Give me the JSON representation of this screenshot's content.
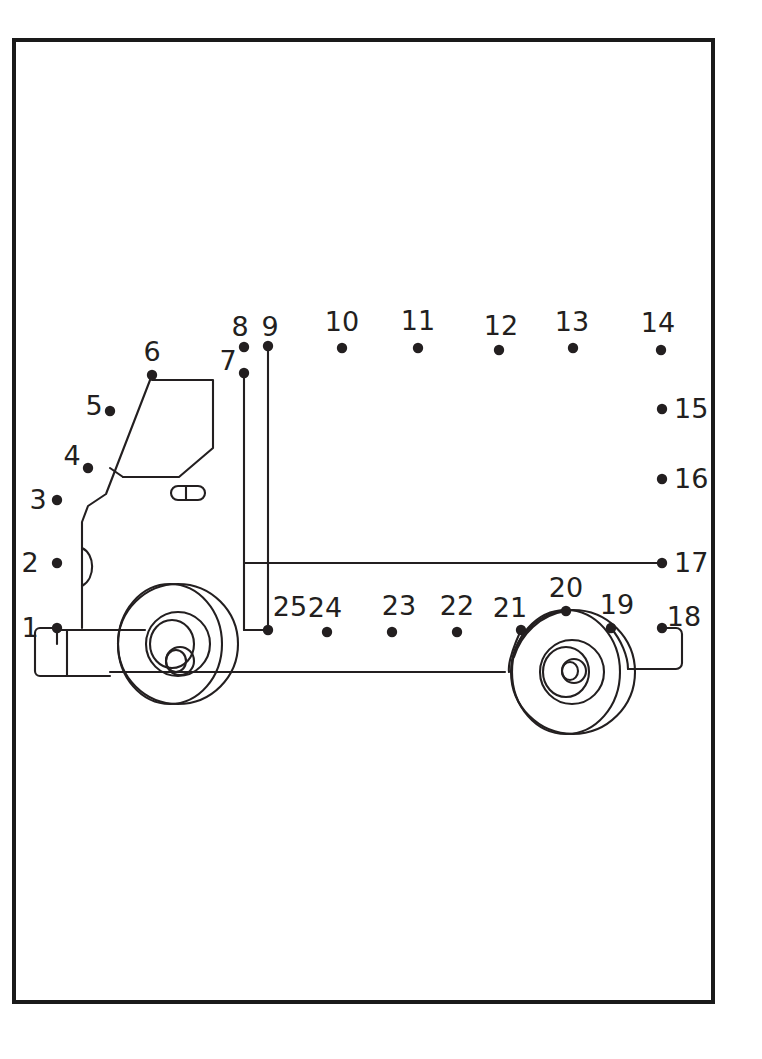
{
  "page": {
    "width": 762,
    "height": 1059,
    "background_color": "#ffffff",
    "ink_color": "#231f20",
    "border_color": "#1a1a1a"
  },
  "frame": {
    "name": "page-border",
    "x": 14,
    "y": 40,
    "width": 699,
    "height": 962,
    "stroke_width": 4
  },
  "puzzle": {
    "type": "connect-the-dots",
    "subject": "truck",
    "dot_count": 25,
    "dot_radius": 5.2,
    "label_font_size": 27,
    "dots": [
      {
        "number": "1",
        "x": 57,
        "y": 628,
        "label_x": 30,
        "label_y": 637,
        "label_anchor": "middle"
      },
      {
        "number": "2",
        "x": 57,
        "y": 563,
        "label_x": 30,
        "label_y": 572,
        "label_anchor": "middle"
      },
      {
        "number": "3",
        "x": 57,
        "y": 500,
        "label_x": 38,
        "label_y": 509,
        "label_anchor": "middle"
      },
      {
        "number": "4",
        "x": 88,
        "y": 468,
        "label_x": 72,
        "label_y": 465,
        "label_anchor": "middle"
      },
      {
        "number": "5",
        "x": 110,
        "y": 411,
        "label_x": 94,
        "label_y": 415,
        "label_anchor": "middle"
      },
      {
        "number": "6",
        "x": 152,
        "y": 375,
        "label_x": 152,
        "label_y": 361,
        "label_anchor": "middle"
      },
      {
        "number": "7",
        "x": 244,
        "y": 373,
        "label_x": 228,
        "label_y": 370,
        "label_anchor": "middle"
      },
      {
        "number": "8",
        "x": 244,
        "y": 347,
        "label_x": 240,
        "label_y": 336,
        "label_anchor": "middle"
      },
      {
        "number": "9",
        "x": 268,
        "y": 346,
        "label_x": 270,
        "label_y": 336,
        "label_anchor": "middle"
      },
      {
        "number": "10",
        "x": 342,
        "y": 348,
        "label_x": 342,
        "label_y": 331,
        "label_anchor": "middle"
      },
      {
        "number": "11",
        "x": 418,
        "y": 348,
        "label_x": 418,
        "label_y": 330,
        "label_anchor": "middle"
      },
      {
        "number": "12",
        "x": 499,
        "y": 350,
        "label_x": 501,
        "label_y": 335,
        "label_anchor": "middle"
      },
      {
        "number": "13",
        "x": 573,
        "y": 348,
        "label_x": 572,
        "label_y": 331,
        "label_anchor": "middle"
      },
      {
        "number": "14",
        "x": 661,
        "y": 350,
        "label_x": 658,
        "label_y": 332,
        "label_anchor": "middle"
      },
      {
        "number": "15",
        "x": 662,
        "y": 409,
        "label_x": 674,
        "label_y": 418,
        "label_anchor": "start"
      },
      {
        "number": "16",
        "x": 662,
        "y": 479,
        "label_x": 674,
        "label_y": 488,
        "label_anchor": "start"
      },
      {
        "number": "17",
        "x": 662,
        "y": 563,
        "label_x": 674,
        "label_y": 572,
        "label_anchor": "start"
      },
      {
        "number": "18",
        "x": 662,
        "y": 628,
        "label_x": 684,
        "label_y": 626,
        "label_anchor": "middle"
      },
      {
        "number": "19",
        "x": 611,
        "y": 628,
        "label_x": 617,
        "label_y": 614,
        "label_anchor": "middle"
      },
      {
        "number": "20",
        "x": 566,
        "y": 611,
        "label_x": 566,
        "label_y": 597,
        "label_anchor": "middle"
      },
      {
        "number": "21",
        "x": 521,
        "y": 630,
        "label_x": 510,
        "label_y": 617,
        "label_anchor": "middle"
      },
      {
        "number": "22",
        "x": 457,
        "y": 632,
        "label_x": 457,
        "label_y": 615,
        "label_anchor": "middle"
      },
      {
        "number": "23",
        "x": 392,
        "y": 632,
        "label_x": 399,
        "label_y": 615,
        "label_anchor": "middle"
      },
      {
        "number": "24",
        "x": 327,
        "y": 632,
        "label_x": 325,
        "label_y": 617,
        "label_anchor": "middle"
      },
      {
        "number": "25",
        "x": 268,
        "y": 630,
        "label_x": 290,
        "label_y": 616,
        "label_anchor": "middle"
      }
    ],
    "artwork_paths": [
      {
        "name": "cab-front-profile",
        "d": "M 57 628 L 57 644"
      },
      {
        "name": "cab-vertical-front-wall",
        "d": "M 82 628 L 82 522 L 88 506 L 106 494 L 152 375"
      },
      {
        "name": "cab-door-handle-arc",
        "d": "M 82 548 C 95 554 96 578 82 586"
      },
      {
        "name": "cab-window-outline",
        "d": "M 152 380 L 213 380 L 213 448 L 179 477 L 123 477"
      },
      {
        "name": "cab-window-lower-edge",
        "d": "M 123 477 L 110 468"
      },
      {
        "name": "cab-mirror-slot",
        "d": "M 178 486 L 198 486 A 7 7 0 0 1 198 500 L 178 500 A 7 7 0 0 1 178 486 Z"
      },
      {
        "name": "cab-mirror-slot-divider",
        "d": "M 186 486 L 186 500"
      },
      {
        "name": "bumper-outer",
        "d": "M 57 628 L 40 628 A 5 5 0 0 0 35 633 L 35 671 A 5 5 0 0 0 40 676 L 110 676"
      },
      {
        "name": "bumper-inner-line",
        "d": "M 67 630 L 67 676"
      },
      {
        "name": "bumper-top-rail",
        "d": "M 57 630 L 145 630"
      },
      {
        "name": "chassis-lower-rail",
        "d": "M 110 672 L 505 672"
      },
      {
        "name": "deck-top-rail",
        "d": "M 244 563 L 662 563"
      },
      {
        "name": "deck-bottom-rail",
        "d": "M 244 630 L 268 630"
      },
      {
        "name": "post-8-vertical",
        "d": "M 244 373 L 244 630"
      },
      {
        "name": "post-9-vertical",
        "d": "M 268 346 L 268 630"
      },
      {
        "name": "front-wheel-outer-a",
        "d": "M 178 600 m -60 44 a 60 60 0 1 0 120 0 a 60 60 0 1 0 -120 0"
      },
      {
        "name": "front-wheel-outer-b",
        "d": "M 170 600 m -52 44 a 52 60 0 1 0 104 0 a 52 60 0 1 0 -104 0"
      },
      {
        "name": "front-wheel-hub-outer",
        "d": "M 178 644 m -32 0 a 32 32 0 1 0 64 0 a 32 32 0 1 0 -64 0"
      },
      {
        "name": "front-wheel-hub-mid",
        "d": "M 172 644 m -22 0 a 22 24 0 1 0 44 0 a 22 24 0 1 0 -44 0"
      },
      {
        "name": "front-wheel-hub-inner-a",
        "d": "M 180 661 m -14 0 a 14 14 0 1 0 28 0 a 14 14 0 1 0 -28 0"
      },
      {
        "name": "front-wheel-hub-inner-b",
        "d": "M 176 661 m -10 0 a 10 11 0 1 0 20 0 a 10 11 0 1 0 -20 0"
      },
      {
        "name": "rear-wheel-outer-a",
        "d": "M 573 672 m -62 0 a 62 62 0 1 0 124 0 a 62 62 0 1 0 -124 0"
      },
      {
        "name": "rear-wheel-outer-b",
        "d": "M 566 672 m -54 0 a 54 62 0 1 0 108 0 a 54 62 0 1 0 -108 0"
      },
      {
        "name": "rear-wheel-hub-outer",
        "d": "M 572 672 m -32 0 a 32 32 0 1 0 64 0 a 32 32 0 1 0 -64 0"
      },
      {
        "name": "rear-wheel-hub-mid",
        "d": "M 566 672 m -23 0 a 23 25 0 1 0 46 0 a 23 25 0 1 0 -46 0"
      },
      {
        "name": "rear-wheel-hub-inner-a",
        "d": "M 574 671 m -12 0 a 12 12 0 1 0 24 0 a 12 12 0 1 0 -24 0"
      },
      {
        "name": "rear-wheel-hub-inner-b",
        "d": "M 570 671 m -8 0 a 8 9 0 1 0 16 0 a 8 9 0 1 0 -16 0"
      },
      {
        "name": "rear-fender-from-21",
        "d": "M 521 630 C 512 650 508 665 509 672"
      },
      {
        "name": "rear-fender-from-20",
        "d": "M 566 611 C 540 615 521 634 514 657"
      },
      {
        "name": "rear-bumper-from-19",
        "d": "M 611 628 C 621 640 628 656 628 669"
      },
      {
        "name": "rear-bumper-step",
        "d": "M 628 669 L 676 669 A 6 6 0 0 0 682 663 L 682 634 A 6 6 0 0 0 676 628 L 662 628"
      }
    ]
  }
}
